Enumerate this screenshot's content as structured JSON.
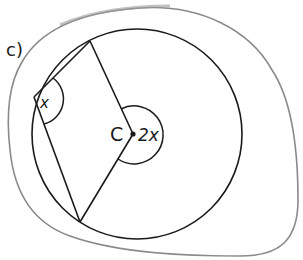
{
  "figure": {
    "part_label": "c)",
    "center_label": "C",
    "inscribed_angle_label": "x",
    "central_angle_label": "2x",
    "colors": {
      "ink": "#1a1a1a",
      "outline": "#8a8a8a",
      "background": "#ffffff"
    }
  }
}
